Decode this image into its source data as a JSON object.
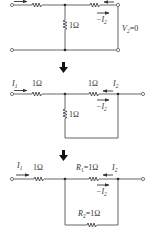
{
  "diagram": {
    "stages": [
      {
        "id": "stage-1",
        "labels": {
          "shunt_resistor": "1Ω",
          "minus_i2": "−I",
          "minus_i2_sub": "2",
          "v2": "V",
          "v2_sub": "2",
          "v2_value": "=0"
        }
      },
      {
        "id": "stage-2",
        "labels": {
          "i1": "I",
          "i1_sub": "1",
          "series_left": "1Ω",
          "series_right": "1Ω",
          "i2": "I",
          "i2_sub": "2",
          "minus_i2": "−I",
          "minus_i2_sub": "2",
          "shunt_resistor": "1Ω"
        }
      },
      {
        "id": "stage-3",
        "labels": {
          "i1": "I",
          "i1_sub": "1",
          "series_left": "1Ω",
          "r1": "R",
          "r1_sub": "1",
          "r1_value": "=1Ω",
          "i2": "I",
          "i2_sub": "2",
          "minus_i2": "−I",
          "minus_i2_sub": "2",
          "r2": "R",
          "r2_sub": "2",
          "r2_value": "=1Ω"
        }
      }
    ],
    "transitions": [
      "down-arrow",
      "down-arrow"
    ],
    "colors": {
      "line": "#555555",
      "text": "#333333",
      "background": "#ffffff"
    }
  }
}
